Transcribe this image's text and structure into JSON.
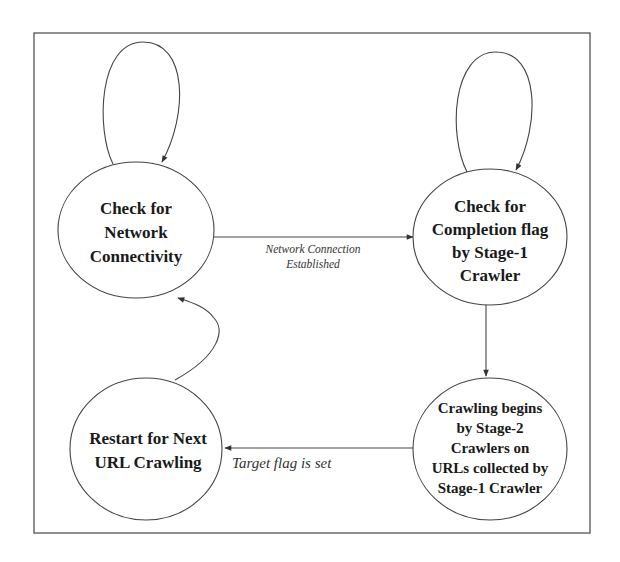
{
  "diagram": {
    "type": "state-transition",
    "colors": {
      "background": "#ffffff",
      "stroke": "#444444",
      "text": "#1a1a1a"
    },
    "nodes": [
      {
        "id": "check-network",
        "lines": [
          "Check for",
          "Network",
          "Connectivity"
        ]
      },
      {
        "id": "check-completion",
        "lines": [
          "Check for",
          "Completion flag",
          "by Stage-1",
          "Crawler"
        ]
      },
      {
        "id": "crawling-begins",
        "lines": [
          "Crawling begins",
          "by Stage-2",
          "Crawlers on",
          "URLs collected by",
          "Stage-1 Crawler"
        ]
      },
      {
        "id": "restart",
        "lines": [
          "Restart for Next",
          "URL Crawling"
        ]
      }
    ],
    "edges": [
      {
        "from": "check-network",
        "to": "check-network",
        "label_lines": []
      },
      {
        "from": "check-network",
        "to": "check-completion",
        "label_lines": [
          "Network Connection",
          "Established"
        ]
      },
      {
        "from": "check-completion",
        "to": "check-completion",
        "label_lines": []
      },
      {
        "from": "check-completion",
        "to": "crawling-begins",
        "label_lines": []
      },
      {
        "from": "crawling-begins",
        "to": "restart",
        "label_lines": [
          "Target flag is set"
        ]
      },
      {
        "from": "restart",
        "to": "check-network",
        "label_lines": []
      }
    ]
  }
}
